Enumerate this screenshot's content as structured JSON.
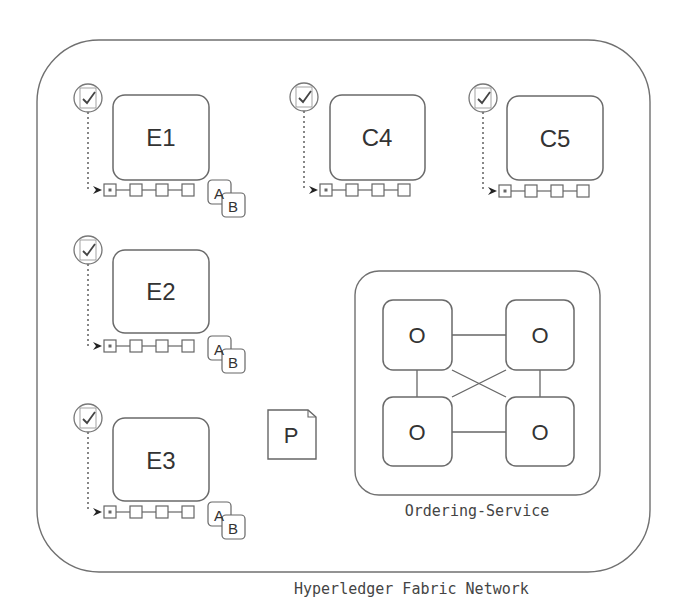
{
  "network": {
    "label": "Hyperledger Fabric Network",
    "border_color": "#707070"
  },
  "peers": [
    {
      "id": "E1",
      "label": "E1",
      "has_chaincode": true,
      "chaincode": [
        "A",
        "B"
      ]
    },
    {
      "id": "C4",
      "label": "C4",
      "has_chaincode": false
    },
    {
      "id": "C5",
      "label": "C5",
      "has_chaincode": false
    },
    {
      "id": "E2",
      "label": "E2",
      "has_chaincode": true,
      "chaincode": [
        "A",
        "B"
      ]
    },
    {
      "id": "E3",
      "label": "E3",
      "has_chaincode": true,
      "chaincode": [
        "A",
        "B"
      ]
    }
  ],
  "policy": {
    "label": "P"
  },
  "ordering_service": {
    "label": "Ordering-Service",
    "nodes": [
      {
        "label": "O"
      },
      {
        "label": "O"
      },
      {
        "label": "O"
      },
      {
        "label": "O"
      }
    ]
  },
  "icons": {
    "certificate": "certificate-check-icon",
    "ledger_block": "ledger-block-icon",
    "chaincode_doc": "chaincode-document-icon",
    "policy_doc": "policy-document-icon"
  }
}
